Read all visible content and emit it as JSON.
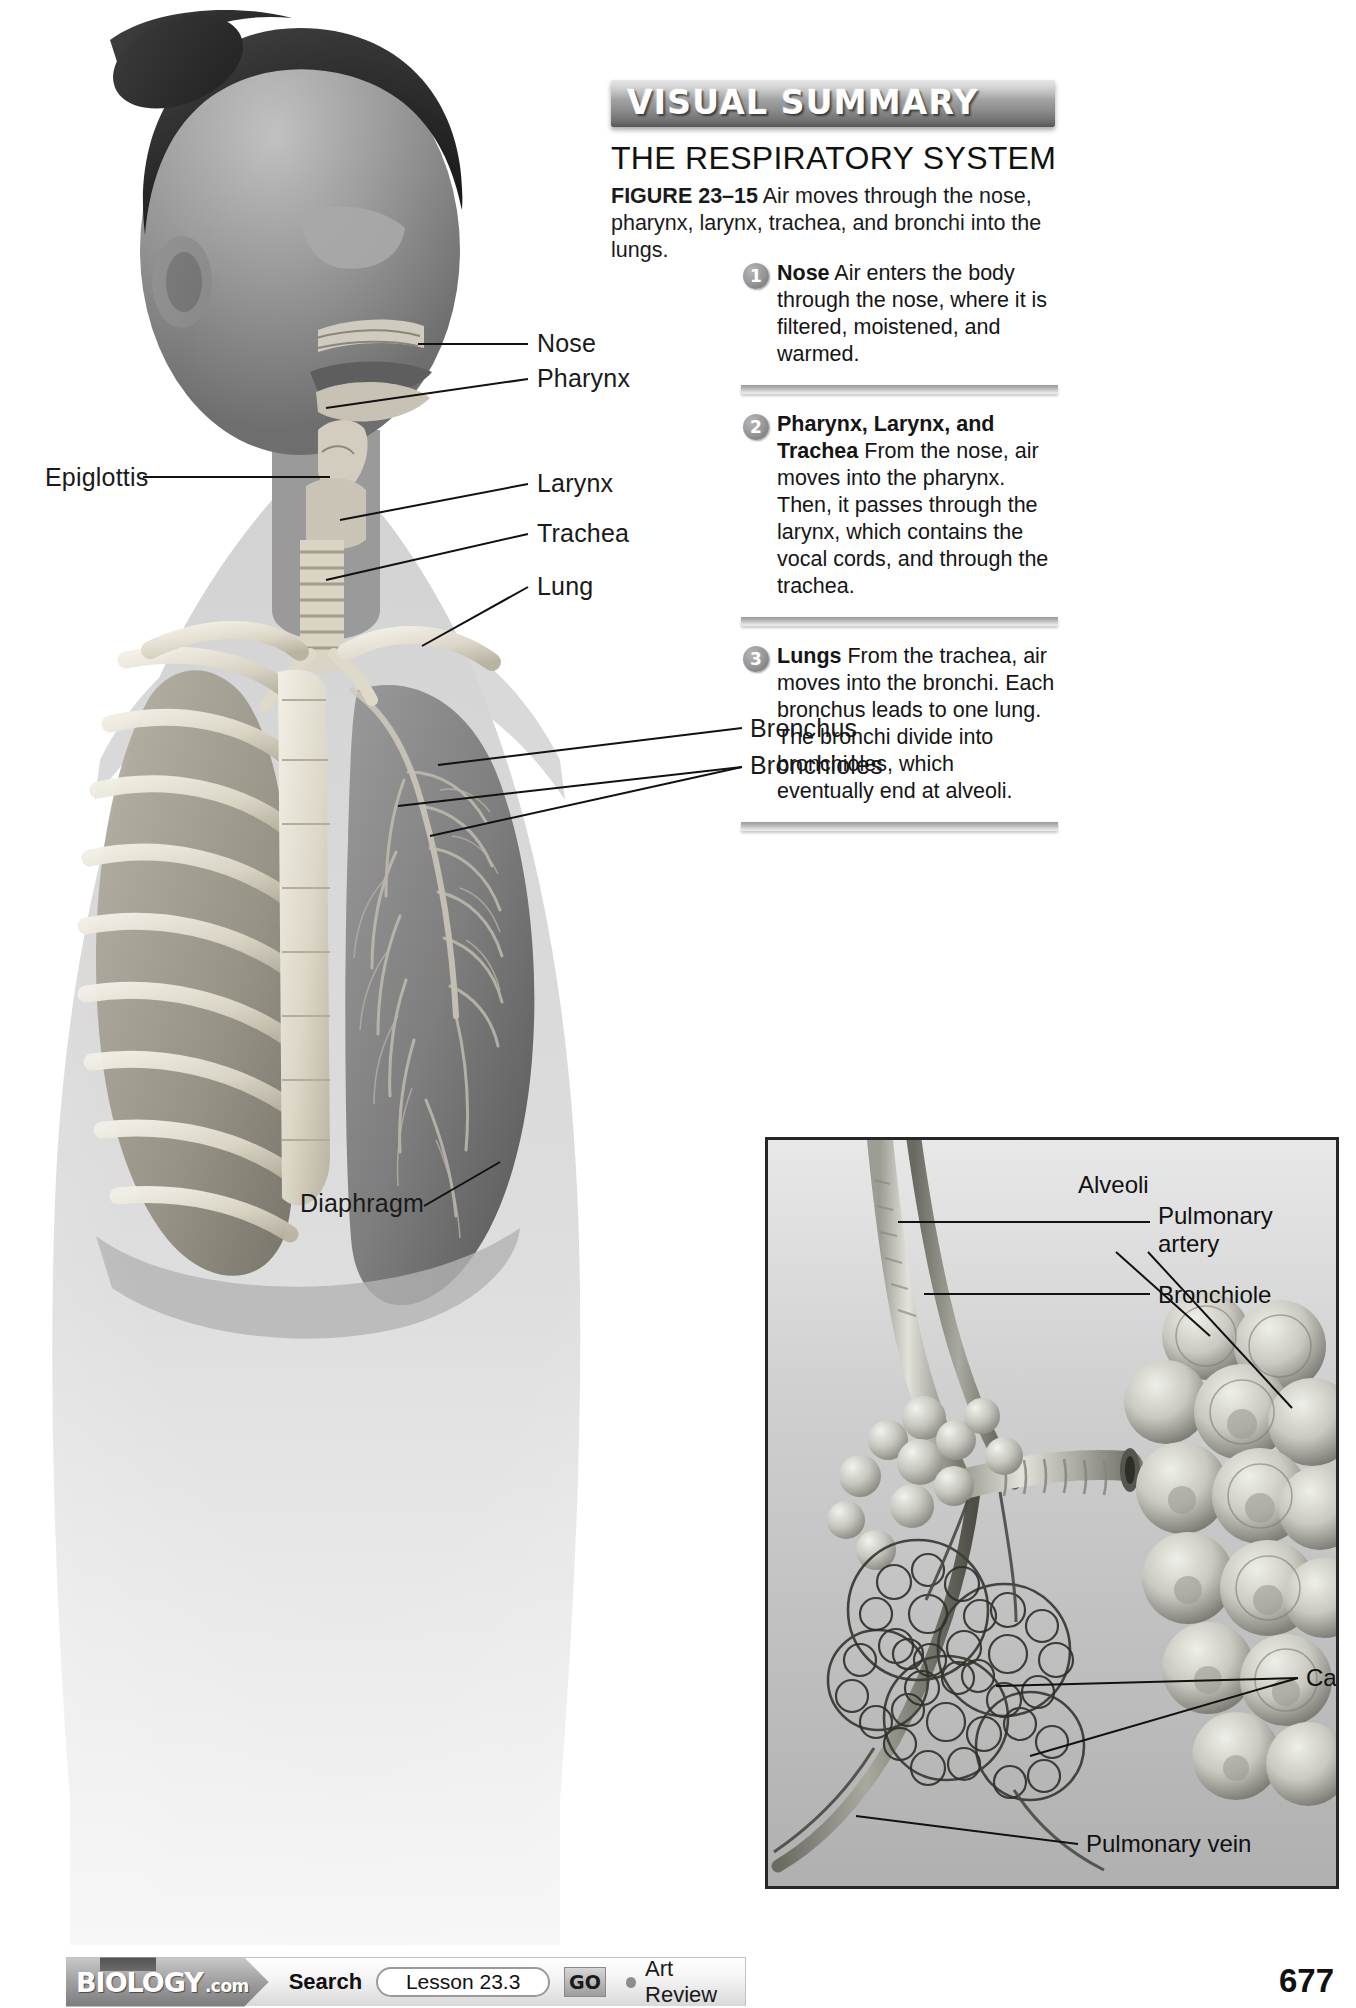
{
  "page": {
    "number": "677"
  },
  "visual_summary": {
    "banner_label": "VISUAL SUMMARY",
    "title": "THE RESPIRATORY SYSTEM",
    "figure_number": "FIGURE 23–15",
    "figure_caption": " Air moves through the nose, pharynx, larynx, trachea, and bronchi into the lungs.",
    "steps": [
      {
        "number": "1",
        "term": "Nose",
        "text": " Air enters the body through the nose, where it is filtered, moistened, and warmed."
      },
      {
        "number": "2",
        "term": "Pharynx, Larynx, and Trachea",
        "text": " From the nose, air moves into the pharynx. Then, it passes through the larynx, which contains the vocal cords, and through the trachea."
      },
      {
        "number": "3",
        "term": "Lungs",
        "text": " From the trachea, air moves into the bronchi. Each bronchus leads to one lung. The bronchi divide into bronchioles, which eventually end at alveoli."
      }
    ]
  },
  "anatomy_labels": {
    "nose": "Nose",
    "pharynx": "Pharynx",
    "epiglottis": "Epiglottis",
    "larynx": "Larynx",
    "trachea": "Trachea",
    "lung": "Lung",
    "bronchus": "Bronchus",
    "bronchioles": "Bronchioles",
    "diaphragm": "Diaphragm"
  },
  "inset_labels": {
    "pulmonary_artery_line1": "Pulmonary",
    "pulmonary_artery_line2": "artery",
    "bronchiole": "Bronchiole",
    "alveoli": "Alveoli",
    "capillaries": "Capillaries",
    "pulmonary_vein": "Pulmonary vein"
  },
  "bottom_bar": {
    "logo_word": "BIOLOGY",
    "logo_suffix": ".com",
    "search_label": "Search",
    "search_value": "Lesson 23.3",
    "go_label": "GO",
    "art_review_label": "Art Review"
  },
  "colors": {
    "banner_dark": "#575757",
    "banner_light": "#c9c9c9",
    "text": "#111111",
    "inset_border": "#262626"
  }
}
